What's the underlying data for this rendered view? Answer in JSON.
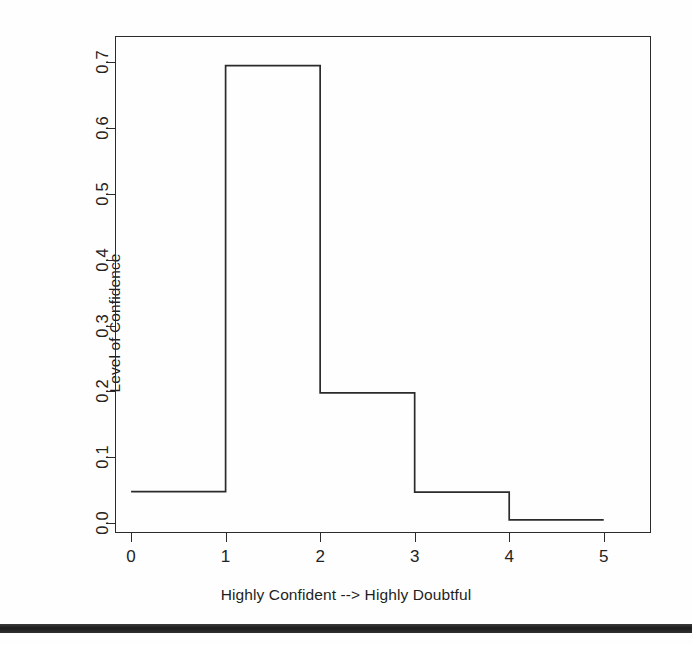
{
  "chart_data": {
    "type": "bar",
    "title": "",
    "subtitle": "",
    "xlabel": "Highly Confident --> Highly Doubtful",
    "ylabel": "Level of Confidence",
    "style": "step-outline histogram (unfilled bars)",
    "grid": false,
    "legend": null,
    "xlim": [
      -0.17,
      5.5
    ],
    "ylim": [
      -0.015,
      0.74
    ],
    "xticks": [
      "0",
      "1",
      "2",
      "3",
      "4",
      "5"
    ],
    "xtick_values": [
      0,
      1,
      2,
      3,
      4,
      5
    ],
    "yticks": [
      "0.0",
      "0.1",
      "0.2",
      "0.3",
      "0.4",
      "0.5",
      "0.6",
      "0.7"
    ],
    "ytick_values": [
      0.0,
      0.1,
      0.2,
      0.3,
      0.4,
      0.5,
      0.6,
      0.7
    ],
    "bins": [
      {
        "x0": 0,
        "x1": 1,
        "value": 0.048
      },
      {
        "x0": 1,
        "x1": 2,
        "value": 0.695
      },
      {
        "x0": 2,
        "x1": 3,
        "value": 0.198
      },
      {
        "x0": 3,
        "x1": 4,
        "value": 0.047
      },
      {
        "x0": 4,
        "x1": 5,
        "value": 0.005
      }
    ],
    "categories": [
      "0-1",
      "1-2",
      "2-3",
      "3-4",
      "4-5"
    ],
    "values": [
      0.048,
      0.695,
      0.198,
      0.047,
      0.005
    ],
    "line_color": "#2b2b2b",
    "fill_color": "none",
    "background_color": "#ffffff"
  },
  "axes": {
    "y_title": "Level of Confidence",
    "x_title": "Highly Confident --> Highly Doubtful"
  }
}
